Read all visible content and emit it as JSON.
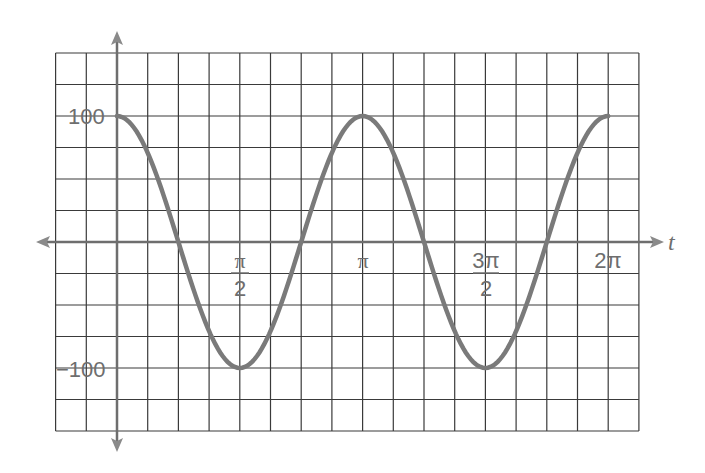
{
  "chart_data": {
    "type": "line",
    "title": "",
    "xlabel": "t",
    "ylabel": "",
    "function": "100*cos(2t)",
    "xlim": [
      0,
      6.2832
    ],
    "ylim": [
      -100,
      100
    ],
    "grid": true,
    "x_ticks": [
      {
        "value": 1.5708,
        "label_num": "π",
        "label_den": "2"
      },
      {
        "value": 3.1416,
        "label": "π"
      },
      {
        "value": 4.7124,
        "label_num": "3π",
        "label_den": "2"
      },
      {
        "value": 6.2832,
        "label": "2π"
      }
    ],
    "y_ticks": [
      {
        "value": 100,
        "label": "100"
      },
      {
        "value": -100,
        "label": "−100"
      }
    ],
    "series": [
      {
        "name": "y",
        "x": [
          0,
          0.3927,
          0.7854,
          1.1781,
          1.5708,
          1.9635,
          2.3562,
          2.7489,
          3.1416,
          3.5343,
          3.927,
          4.3197,
          4.7124,
          5.1051,
          5.4978,
          5.8905,
          6.2832
        ],
        "values": [
          100,
          70.7,
          0,
          -70.7,
          -100,
          -70.7,
          0,
          70.7,
          100,
          70.7,
          0,
          -70.7,
          -100,
          -70.7,
          0,
          70.7,
          100
        ]
      }
    ],
    "colors": {
      "curve": "#7a7a7a",
      "grid": "#3a3a3a",
      "axis": "#6e6e6e",
      "text": "#6e6e6e"
    }
  },
  "labels": {
    "y_100": "100",
    "y_neg100": "−100",
    "x_pi_half_num": "π",
    "x_pi_half_den": "2",
    "x_pi": "π",
    "x_3pi_half_num": "3π",
    "x_3pi_half_den": "2",
    "x_2pi": "2π",
    "t_axis": "t"
  }
}
